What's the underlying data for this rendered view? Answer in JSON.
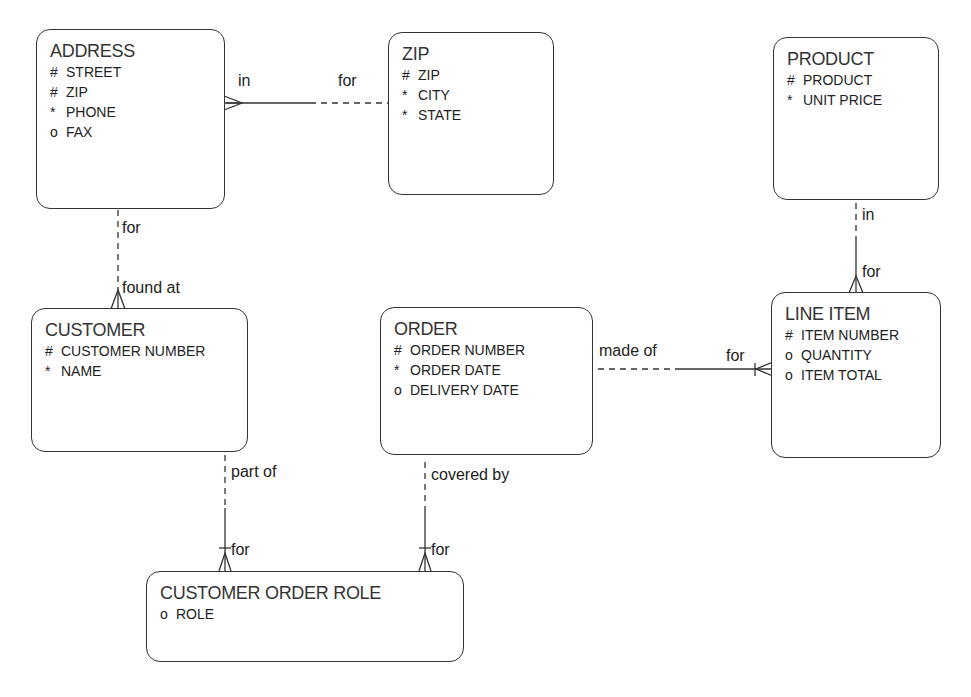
{
  "diagram": {
    "type": "entity-relationship",
    "entities": [
      {
        "id": "address",
        "title": "ADDRESS",
        "attributes": [
          {
            "marker": "#",
            "name": "STREET"
          },
          {
            "marker": "#",
            "name": "ZIP"
          },
          {
            "marker": "*",
            "name": "PHONE"
          },
          {
            "marker": "o",
            "name": "FAX"
          }
        ]
      },
      {
        "id": "zip",
        "title": "ZIP",
        "attributes": [
          {
            "marker": "#",
            "name": "ZIP"
          },
          {
            "marker": "*",
            "name": "CITY"
          },
          {
            "marker": "*",
            "name": "STATE"
          }
        ]
      },
      {
        "id": "product",
        "title": "PRODUCT",
        "attributes": [
          {
            "marker": "#",
            "name": "PRODUCT"
          },
          {
            "marker": "*",
            "name": "UNIT PRICE"
          }
        ]
      },
      {
        "id": "customer",
        "title": "CUSTOMER",
        "attributes": [
          {
            "marker": "#",
            "name": "CUSTOMER NUMBER"
          },
          {
            "marker": "*",
            "name": "NAME"
          }
        ]
      },
      {
        "id": "order",
        "title": "ORDER",
        "attributes": [
          {
            "marker": "#",
            "name": "ORDER NUMBER"
          },
          {
            "marker": "*",
            "name": "ORDER DATE"
          },
          {
            "marker": "o",
            "name": "DELIVERY DATE"
          }
        ]
      },
      {
        "id": "line_item",
        "title": "LINE ITEM",
        "attributes": [
          {
            "marker": "#",
            "name": "ITEM NUMBER"
          },
          {
            "marker": "o",
            "name": "QUANTITY"
          },
          {
            "marker": "o",
            "name": "ITEM TOTAL"
          }
        ]
      },
      {
        "id": "customer_order_role",
        "title": "CUSTOMER ORDER ROLE",
        "attributes": [
          {
            "marker": "o",
            "name": "ROLE"
          }
        ]
      }
    ],
    "relationships": [
      {
        "from": "address",
        "to": "zip",
        "from_label": "in",
        "to_label": "for"
      },
      {
        "from": "address",
        "to": "customer",
        "from_label": "for",
        "to_label": "found at"
      },
      {
        "from": "product",
        "to": "line_item",
        "from_label": "in",
        "to_label": "for"
      },
      {
        "from": "order",
        "to": "line_item",
        "from_label": "made of",
        "to_label": "for"
      },
      {
        "from": "customer",
        "to": "customer_order_role",
        "from_label": "part of",
        "to_label": "for"
      },
      {
        "from": "order",
        "to": "customer_order_role",
        "from_label": "covered by",
        "to_label": "for"
      }
    ]
  }
}
